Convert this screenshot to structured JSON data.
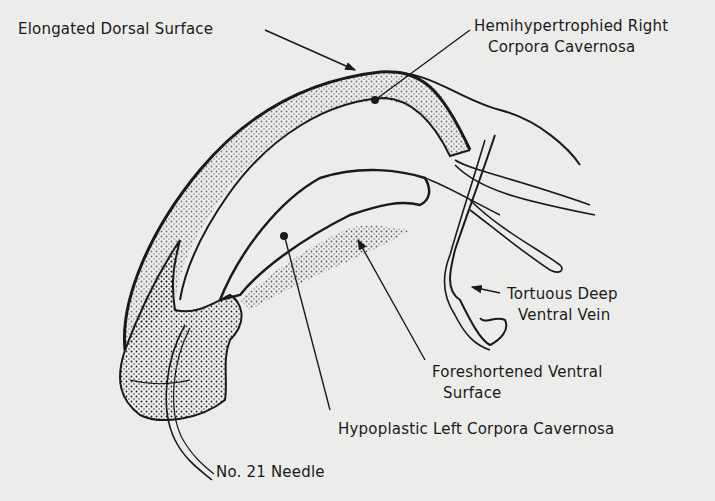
{
  "figure": {
    "background": "#ececea",
    "ink": "#1a1a1a",
    "labels": {
      "dorsal": "Elongated Dorsal Surface",
      "right_cc_line1": "Hemihypertrophied Right",
      "right_cc_line2": "Corpora Cavernosa",
      "vein_line1": "Tortuous Deep",
      "vein_line2": "Ventral Vein",
      "ventral_line1": "Foreshortened Ventral",
      "ventral_line2": "Surface",
      "left_cc": "Hypoplastic Left Corpora Cavernosa",
      "needle": "No. 21 Needle"
    }
  }
}
